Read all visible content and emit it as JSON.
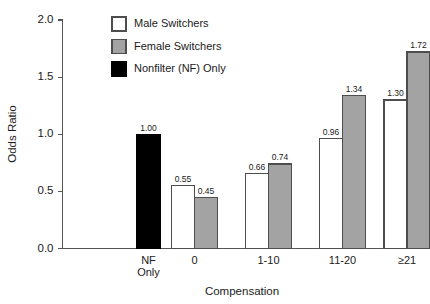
{
  "chart_data": {
    "type": "bar",
    "title": "",
    "xlabel": "Compensation",
    "ylabel": "Odds Ratio",
    "ylim": [
      0.0,
      2.0
    ],
    "ytick_labels": [
      "0.0",
      "0.5",
      "1.0",
      "1.5",
      "2.0"
    ],
    "ytick_values": [
      0.0,
      0.5,
      1.0,
      1.5,
      2.0
    ],
    "grid": false,
    "legend_position": "top-center",
    "categories": [
      "NF Only",
      "0",
      "1-10",
      "11-20",
      "≥21"
    ],
    "category_lines": [
      [
        "NF",
        "Only"
      ],
      [
        "0"
      ],
      [
        "1-10"
      ],
      [
        "11-20"
      ],
      [
        "≥21"
      ]
    ],
    "series": [
      {
        "name": "Male Switchers",
        "fill": "#ffffff",
        "stroke": "#4d4d4d",
        "values": [
          null,
          0.55,
          0.66,
          0.96,
          1.3
        ],
        "labels": [
          "",
          "0.55",
          "0.66",
          "0.96",
          "1.30"
        ]
      },
      {
        "name": "Female Switchers",
        "fill": "#a3a3a3",
        "stroke": "#4d4d4d",
        "values": [
          null,
          0.45,
          0.74,
          1.34,
          1.72
        ],
        "labels": [
          "",
          "0.45",
          "0.74",
          "1.34",
          "1.72"
        ]
      },
      {
        "name": "Nonfilter (NF) Only",
        "fill": "#000000",
        "stroke": "#000000",
        "values": [
          1.0,
          null,
          null,
          null,
          null
        ],
        "labels": [
          "1.00",
          "",
          "",
          "",
          ""
        ]
      }
    ],
    "legend": [
      {
        "label": "Male Switchers",
        "fill": "#ffffff",
        "stroke": "#4d4d4d"
      },
      {
        "label": "Female Switchers",
        "fill": "#a3a3a3",
        "stroke": "#4d4d4d"
      },
      {
        "label": "Nonfilter (NF) Only",
        "fill": "#000000",
        "stroke": "#000000"
      }
    ]
  }
}
